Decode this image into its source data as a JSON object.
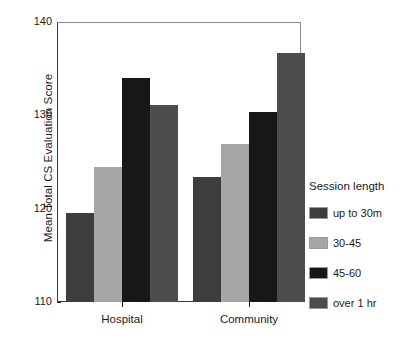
{
  "chart_data": {
    "type": "bar",
    "title": "",
    "subtitle": "",
    "xlabel": "",
    "ylabel": "Mean Total CS Evaluation Score",
    "categories": [
      "Hospital",
      "Community"
    ],
    "ylim": [
      110,
      140
    ],
    "yticks": [
      110,
      120,
      130,
      140
    ],
    "ytick_labels": [
      "110",
      "120",
      "130",
      "140"
    ],
    "grid": false,
    "legend_position": "right",
    "legend_title": "Session length",
    "series": [
      {
        "name": "up to 30m",
        "color": "#3d3d3d",
        "values": [
          119.5,
          123.4
        ]
      },
      {
        "name": "30-45",
        "color": "#a6a6a6",
        "values": [
          124.5,
          126.9
        ]
      },
      {
        "name": "45-60",
        "color": "#171717",
        "values": [
          134.0,
          130.4
        ]
      },
      {
        "name": "over 1 hr",
        "color": "#4d4d4d",
        "values": [
          131.1,
          136.7
        ]
      }
    ]
  },
  "axes": {
    "y_axis_title": "Mean Total CS Evaluation Score",
    "y_tick_140": "140",
    "y_tick_130": "130",
    "y_tick_120": "120",
    "y_tick_110": "110",
    "x_group_1": "Hospital",
    "x_group_2": "Community"
  },
  "legend": {
    "title": "Session length",
    "items": [
      {
        "label": "up to 30m",
        "color": "#3d3d3d"
      },
      {
        "label": "30-45",
        "color": "#a6a6a6"
      },
      {
        "label": "45-60",
        "color": "#171717"
      },
      {
        "label": "over 1 hr",
        "color": "#4d4d4d"
      }
    ]
  }
}
